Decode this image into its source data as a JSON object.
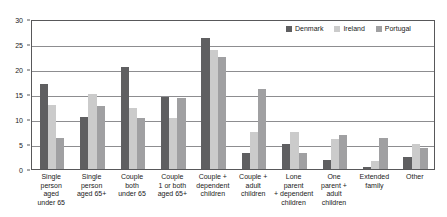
{
  "chart_data": {
    "type": "bar",
    "title": "",
    "xlabel": "",
    "ylabel": "",
    "ylim": [
      0,
      30
    ],
    "yticks": [
      0,
      5,
      10,
      15,
      20,
      25,
      30
    ],
    "ytick_labels": [
      "0",
      "5",
      "10",
      "15",
      "20",
      "25",
      "30"
    ],
    "grid": true,
    "legend_position": "top-right",
    "categories": [
      "Single person aged under 65",
      "Single person aged 65+",
      "Couple both under 65",
      "Couple 1 or both aged 65+",
      "Couple + dependent children",
      "Couple + adult children",
      "Lone parent + dependent children",
      "One parent + adult children",
      "Extended family",
      "Other"
    ],
    "category_lines": [
      [
        "Single",
        "person",
        "aged",
        "under 65"
      ],
      [
        "Single",
        "person",
        "aged 65+"
      ],
      [
        "Couple",
        "both",
        "under 65"
      ],
      [
        "Couple",
        "1 or both",
        "aged 65+"
      ],
      [
        "Couple +",
        "dependent",
        "children"
      ],
      [
        "Couple +",
        "adult",
        "children"
      ],
      [
        "Lone",
        "parent",
        "+ dependent",
        "children"
      ],
      [
        "One",
        "parent +",
        "adult",
        "children"
      ],
      [
        "Extended",
        "family"
      ],
      [
        "Other"
      ]
    ],
    "series": [
      {
        "name": "Denmark",
        "color": "#5f5f61",
        "values": [
          17.0,
          10.4,
          20.4,
          14.4,
          26.2,
          3.2,
          5.0,
          1.9,
          0.5,
          2.5
        ]
      },
      {
        "name": "Ireland",
        "color": "#cbcbcb",
        "values": [
          12.8,
          15.0,
          12.3,
          10.2,
          23.8,
          7.4,
          7.4,
          6.0,
          1.6,
          5.0
        ]
      },
      {
        "name": "Portugal",
        "color": "#a0a0a2",
        "values": [
          6.3,
          12.6,
          10.2,
          14.2,
          22.5,
          16.0,
          3.2,
          6.8,
          6.2,
          4.2
        ]
      }
    ]
  },
  "legend": {
    "entries": [
      {
        "label": "Denmark"
      },
      {
        "label": "Ireland"
      },
      {
        "label": "Portugal"
      }
    ]
  }
}
